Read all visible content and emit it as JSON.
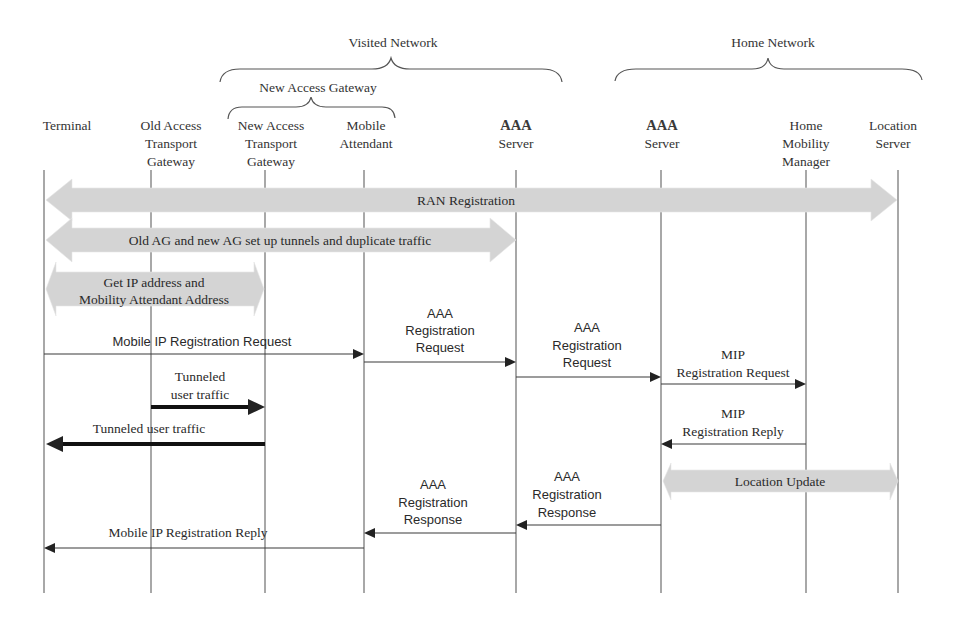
{
  "groups": {
    "visited": {
      "label": "Visited Network"
    },
    "new_access_gateway": {
      "label": "New Access Gateway"
    },
    "home": {
      "label": "Home Network"
    }
  },
  "participants": [
    {
      "id": "terminal",
      "lines": [
        "Terminal"
      ]
    },
    {
      "id": "old-access-transport-gateway",
      "lines": [
        "Old Access",
        "Transport",
        "Gateway"
      ]
    },
    {
      "id": "new-access-transport-gateway",
      "lines": [
        "New Access",
        "Transport",
        "Gateway"
      ]
    },
    {
      "id": "mobile-attendant",
      "lines": [
        "Mobile",
        "Attendant"
      ]
    },
    {
      "id": "visited-aaa-server",
      "lines": [
        "AAA",
        "Server"
      ]
    },
    {
      "id": "home-aaa-server",
      "lines": [
        "AAA",
        "Server"
      ]
    },
    {
      "id": "home-mobility-manager",
      "lines": [
        "Home",
        "Mobility",
        "Manager"
      ]
    },
    {
      "id": "location-server",
      "lines": [
        "Location",
        "Server"
      ]
    }
  ],
  "messages": [
    {
      "type": "block-bidirectional",
      "from": 0,
      "to": 7,
      "lines": [
        "RAN Registration"
      ]
    },
    {
      "type": "block-bidirectional",
      "from": 0,
      "to": 4,
      "lines": [
        "Old AG and new AG set up tunnels and duplicate traffic"
      ]
    },
    {
      "type": "block-bidirectional",
      "from": 0,
      "to": 2,
      "lines": [
        "Get IP address and",
        "Mobility Attendant Address"
      ]
    },
    {
      "type": "arrow",
      "from": 0,
      "to": 3,
      "lines": [
        "Mobile IP Registration Request"
      ]
    },
    {
      "type": "arrow",
      "from": 3,
      "to": 4,
      "lines": [
        "AAA",
        "Registration",
        "Request"
      ]
    },
    {
      "type": "arrow",
      "from": 4,
      "to": 5,
      "lines": [
        "AAA",
        "Registration",
        "Request"
      ]
    },
    {
      "type": "arrow",
      "from": 5,
      "to": 6,
      "lines": [
        "MIP",
        "Registration Request"
      ]
    },
    {
      "type": "thick-arrow",
      "from": 1,
      "to": 2,
      "lines": [
        "Tunneled",
        "user traffic"
      ]
    },
    {
      "type": "arrow",
      "from": 6,
      "to": 5,
      "lines": [
        "MIP",
        "Registration Reply"
      ]
    },
    {
      "type": "thick-arrow",
      "from": 2,
      "to": 0,
      "lines": [
        "Tunneled user traffic"
      ]
    },
    {
      "type": "block-bidirectional",
      "from": 5,
      "to": 7,
      "lines": [
        "Location Update"
      ]
    },
    {
      "type": "arrow",
      "from": 5,
      "to": 4,
      "lines": [
        "AAA",
        "Registration",
        "Response"
      ]
    },
    {
      "type": "arrow",
      "from": 4,
      "to": 3,
      "lines": [
        "AAA",
        "Registration",
        "Response"
      ]
    },
    {
      "type": "arrow",
      "from": 3,
      "to": 0,
      "lines": [
        "Mobile IP Registration Reply"
      ]
    }
  ],
  "colors": {
    "block_fill": "#d4d4d4",
    "line": "#3a3a3a",
    "text": "#2a2a2a",
    "background": "#ffffff"
  }
}
